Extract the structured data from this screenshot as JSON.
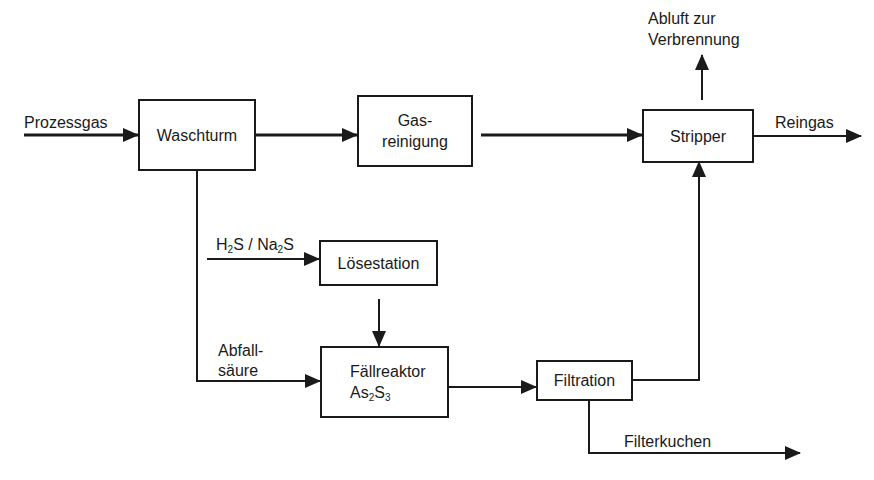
{
  "diagram": {
    "type": "process-flow",
    "nodes": {
      "waschturm": {
        "label": "Waschturm"
      },
      "gasreinigung": {
        "line1": "Gas-",
        "line2": "reinigung"
      },
      "stripper": {
        "label": "Stripper"
      },
      "loesestation": {
        "label": "Lösestation"
      },
      "faellreaktor": {
        "line1": "Fällreaktor",
        "formula_a": "As",
        "sub_a": "2",
        "formula_b": "S",
        "sub_b": "3"
      },
      "filtration": {
        "label": "Filtration"
      }
    },
    "flows": {
      "prozessgas": "Prozessgas",
      "reingas": "Reingas",
      "abluft_line1": "Abluft zur",
      "abluft_line2": "Verbrennung",
      "h2s": {
        "h": "H",
        "sub1": "2",
        "s": "S / Na",
        "sub2": "2",
        "end": "S"
      },
      "abfall_line1": "Abfall-",
      "abfall_line2": "säure",
      "filterkuchen": "Filterkuchen"
    },
    "edges": [
      {
        "from": "Prozessgas",
        "to": "Waschturm"
      },
      {
        "from": "Waschturm",
        "to": "Gas-reinigung"
      },
      {
        "from": "Gas-reinigung",
        "to": "Stripper"
      },
      {
        "from": "Stripper",
        "to": "Reingas"
      },
      {
        "from": "Stripper",
        "to": "Abluft zur Verbrennung"
      },
      {
        "from": "H2S / Na2S",
        "to": "Lösestation"
      },
      {
        "from": "Lösestation",
        "to": "Fällreaktor As2S3"
      },
      {
        "from": "Waschturm",
        "to": "Fällreaktor As2S3",
        "label": "Abfallsäure"
      },
      {
        "from": "Fällreaktor As2S3",
        "to": "Filtration"
      },
      {
        "from": "Filtration",
        "to": "Stripper"
      },
      {
        "from": "Filtration",
        "to": "Filterkuchen"
      }
    ],
    "colors": {
      "stroke": "#1a1a1a",
      "background": "#ffffff"
    }
  }
}
